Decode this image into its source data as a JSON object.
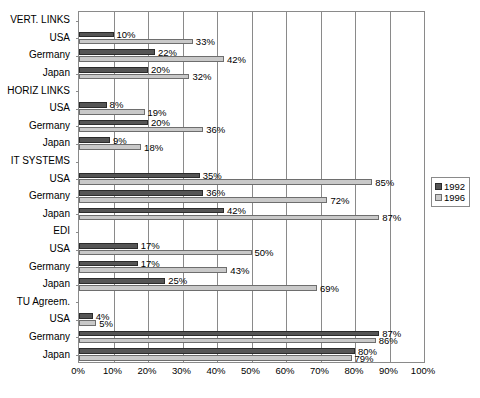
{
  "chart_data": {
    "type": "bar",
    "orientation": "horizontal",
    "title": "",
    "xlabel": "",
    "ylabel": "",
    "xlim": [
      0,
      100
    ],
    "xticks": [
      "0%",
      "10%",
      "20%",
      "30%",
      "40%",
      "50%",
      "60%",
      "70%",
      "80%",
      "90%",
      "100%"
    ],
    "grid": true,
    "legend": {
      "position": "right",
      "entries": [
        {
          "name": "1992",
          "color": "#555555"
        },
        {
          "name": "1996",
          "color": "#c9c9c9"
        }
      ]
    },
    "series": [
      {
        "name": "1992",
        "color": "#555555"
      },
      {
        "name": "1996",
        "color": "#c9c9c9"
      }
    ],
    "groups": [
      {
        "label": "VERT. LINKS",
        "rows": [
          {
            "label": "USA",
            "v1992": 10,
            "v1996": 33,
            "l1992": "10%",
            "l1996": "33%"
          },
          {
            "label": "Germany",
            "v1992": 22,
            "v1996": 42,
            "l1992": "22%",
            "l1996": "42%"
          },
          {
            "label": "Japan",
            "v1992": 20,
            "v1996": 32,
            "l1992": "20%",
            "l1996": "32%"
          }
        ]
      },
      {
        "label": "HORIZ LINKS",
        "rows": [
          {
            "label": "USA",
            "v1992": 8,
            "v1996": 19,
            "l1992": "8%",
            "l1996": "19%"
          },
          {
            "label": "Germany",
            "v1992": 20,
            "v1996": 36,
            "l1992": "20%",
            "l1996": "36%"
          },
          {
            "label": "Japan",
            "v1992": 9,
            "v1996": 18,
            "l1992": "9%",
            "l1996": "18%"
          }
        ]
      },
      {
        "label": "IT SYSTEMS",
        "rows": [
          {
            "label": "USA",
            "v1992": 35,
            "v1996": 85,
            "l1992": "35%",
            "l1996": "85%"
          },
          {
            "label": "Germany",
            "v1992": 36,
            "v1996": 72,
            "l1992": "36%",
            "l1996": "72%"
          },
          {
            "label": "Japan",
            "v1992": 42,
            "v1996": 87,
            "l1992": "42%",
            "l1996": "87%"
          }
        ]
      },
      {
        "label": "EDI",
        "rows": [
          {
            "label": "USA",
            "v1992": 17,
            "v1996": 50,
            "l1992": "17%",
            "l1996": "50%"
          },
          {
            "label": "Germany",
            "v1992": 17,
            "v1996": 43,
            "l1992": "17%",
            "l1996": "43%"
          },
          {
            "label": "Japan",
            "v1992": 25,
            "v1996": 69,
            "l1992": "25%",
            "l1996": "69%"
          }
        ]
      },
      {
        "label": "TU Agreem.",
        "rows": [
          {
            "label": "USA",
            "v1992": 4,
            "v1996": 5,
            "l1992": "4%",
            "l1996": "5%"
          },
          {
            "label": "Germany",
            "v1992": 87,
            "v1996": 86,
            "l1992": "87%",
            "l1996": "86%"
          },
          {
            "label": "Japan",
            "v1992": 80,
            "v1996": 79,
            "l1992": "80%",
            "l1996": "79%"
          }
        ]
      }
    ]
  }
}
